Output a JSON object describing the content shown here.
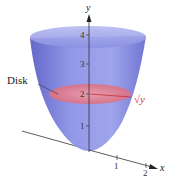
{
  "figure": {
    "type": "paraboloid-solid-of-revolution",
    "axes": {
      "y_label": "y",
      "x_label": "x",
      "y_ticks": [
        "1",
        "2",
        "3",
        "4"
      ],
      "x_ticks": [
        "1",
        "2"
      ]
    },
    "annotations": {
      "disk_label": "Disk",
      "radius_label": "√y"
    },
    "colors": {
      "solid": "#7f86e0",
      "solid_dark": "#5a5fc8",
      "disk": "#e87a8a",
      "radius_text": "#d8343e",
      "axis": "#333333"
    }
  }
}
